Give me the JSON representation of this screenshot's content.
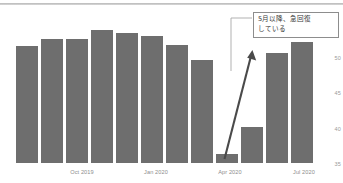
{
  "chart_data": {
    "type": "bar",
    "title": "",
    "xlabel": "",
    "ylabel": "",
    "categories": [
      "Aug 2019",
      "Sep 2019",
      "Oct 2019",
      "Nov 2019",
      "Dec 2019",
      "Jan 2020",
      "Feb 2020",
      "Mar 2020",
      "Apr 2020",
      "May 2020",
      "Jun 2020",
      "Jul 2020"
    ],
    "values": [
      51.2,
      51.9,
      51.9,
      52.7,
      52.5,
      52.2,
      51.3,
      49.7,
      36.6,
      39.8,
      50.4,
      51.6
    ],
    "ylim": [
      35,
      52.5
    ],
    "yticks": [
      "50",
      "45",
      "40",
      "35"
    ],
    "ytick_values": [
      50,
      45,
      40,
      35
    ],
    "xtick_labels": [
      "Oct 2019",
      "Jan 2020",
      "Apr 2020",
      "Jul 2020"
    ],
    "xtick_indices": [
      2,
      5,
      8,
      11
    ],
    "grid": false,
    "legend": null,
    "series_color": "#6e6e6e",
    "annotations": [
      {
        "name": "recovery-callout",
        "text": "5月以降、急回復\nしている",
        "arrow": "upward-trend-arrow",
        "arrow_from_category": "Apr 2020",
        "arrow_to_category": "Jun 2020"
      }
    ]
  },
  "callout": {
    "line1": "5月以降、急回復",
    "line2": "している",
    "text": "5月以降、急回復\nしている"
  },
  "axis": {
    "y_ticks": [
      {
        "label": "50",
        "top": 55
      },
      {
        "label": "45",
        "top": 90
      },
      {
        "label": "40",
        "top": 126
      },
      {
        "label": "35",
        "top": 161
      }
    ],
    "x_ticks": [
      {
        "label": "Oct 2019",
        "center": 82
      },
      {
        "label": "Jan 2020",
        "center": 156
      },
      {
        "label": "Apr 2020",
        "center": 230
      },
      {
        "label": "Jul 2020",
        "center": 304
      }
    ]
  },
  "bars": [
    {
      "label": "Aug 2019",
      "value": 51.2,
      "x": 16,
      "w": 22,
      "top": 46,
      "h": 117
    },
    {
      "label": "Sep 2019",
      "value": 51.9,
      "x": 41,
      "w": 22,
      "top": 39,
      "h": 124
    },
    {
      "label": "Oct 2019",
      "value": 51.9,
      "x": 66,
      "w": 22,
      "top": 39,
      "h": 124
    },
    {
      "label": "Nov 2019",
      "value": 52.7,
      "x": 91,
      "w": 22,
      "top": 30,
      "h": 133
    },
    {
      "label": "Dec 2019",
      "value": 52.5,
      "x": 116,
      "w": 22,
      "top": 33,
      "h": 130
    },
    {
      "label": "Jan 2020",
      "value": 52.2,
      "x": 141,
      "w": 22,
      "top": 36,
      "h": 127
    },
    {
      "label": "Feb 2020",
      "value": 51.3,
      "x": 166,
      "w": 22,
      "top": 45,
      "h": 118
    },
    {
      "label": "Mar 2020",
      "value": 49.7,
      "x": 191,
      "w": 22,
      "top": 60,
      "h": 103
    },
    {
      "label": "Apr 2020",
      "value": 36.6,
      "x": 216,
      "w": 22,
      "top": 154,
      "h": 9
    },
    {
      "label": "May 2020",
      "value": 39.8,
      "x": 241,
      "w": 22,
      "top": 127,
      "h": 36
    },
    {
      "label": "Jun 2020",
      "value": 50.4,
      "x": 266,
      "w": 22,
      "top": 53,
      "h": 110
    },
    {
      "label": "Jul 2020",
      "value": 51.6,
      "x": 291,
      "w": 22,
      "top": 42,
      "h": 121
    }
  ]
}
